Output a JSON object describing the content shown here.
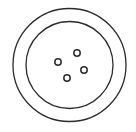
{
  "figure": {
    "subject": "sewing button",
    "stroke_color": "#2b2b2b",
    "background": "#ffffff",
    "outer_ring": {
      "cx": 69.5,
      "cy": 65,
      "r": 56.5
    },
    "inner_ring": {
      "cx": 69.5,
      "cy": 65,
      "r": 43.5
    },
    "holes": [
      {
        "cx": 58,
        "cy": 62,
        "r": 3.2
      },
      {
        "cx": 77,
        "cy": 53,
        "r": 3.2
      },
      {
        "cx": 84,
        "cy": 70,
        "r": 3.2
      },
      {
        "cx": 67,
        "cy": 78,
        "r": 3.2
      }
    ]
  }
}
